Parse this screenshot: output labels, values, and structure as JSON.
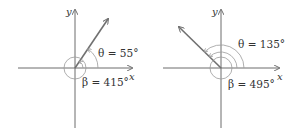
{
  "figures": [
    {
      "id": "left",
      "x_label": "x",
      "y_label": "y",
      "theta_label": "θ = 55°",
      "beta_label": "β = 415°",
      "theta_deg": 55,
      "beta_deg": 415
    },
    {
      "id": "right",
      "x_label": "x",
      "y_label": "y",
      "theta_label": "θ = 135°",
      "beta_label": "β = 495°",
      "theta_deg": 135,
      "beta_deg": 495
    }
  ],
  "colors": {
    "axis": "#6d6d6d",
    "ray": "#707070",
    "arc": "#9a9a9a",
    "text": "#333333"
  }
}
